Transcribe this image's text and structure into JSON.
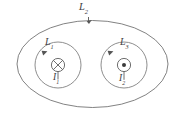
{
  "figure": {
    "name": "amperian-loops-diagram",
    "stroke_color": "#6b6b6b",
    "background_color": "#ffffff",
    "labels": {
      "outer_loop": {
        "base": "L",
        "sub": "2"
      },
      "left_loop": {
        "base": "L",
        "sub": "1"
      },
      "right_loop": {
        "base": "L",
        "sub": "3"
      },
      "left_current": {
        "base": "I",
        "sub": "1"
      },
      "right_current": {
        "base": "I",
        "sub": "2"
      }
    },
    "elements": {
      "outer_ellipse": {
        "cx": 92.5,
        "cy": 64,
        "rx": 76,
        "ry": 44
      },
      "left_loop": {
        "cx": 58,
        "cy": 65,
        "r": 23
      },
      "right_loop": {
        "cx": 124,
        "cy": 65,
        "r": 23
      },
      "left_wire_symbol": {
        "cx": 58,
        "cy": 65,
        "r": 7,
        "glyph": "cross-in-circle",
        "meaning": "current-into-page"
      },
      "right_wire_symbol": {
        "cx": 124,
        "cy": 65,
        "r": 7,
        "glyph": "dot-in-circle",
        "meaning": "current-out-of-page"
      }
    }
  }
}
